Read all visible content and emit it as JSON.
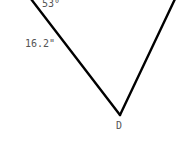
{
  "diagram": {
    "type": "geometry-figure",
    "vertices": {
      "bottom": "D"
    },
    "labels": {
      "angle": "53°",
      "side_length": "16.2\"",
      "vertex_d": "D"
    },
    "colors": {
      "line": "#000000",
      "text": "#555555",
      "background": "#ffffff"
    }
  }
}
